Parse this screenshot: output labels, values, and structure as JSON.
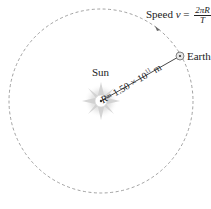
{
  "diagram": {
    "orbit": {
      "cx": 101,
      "cy": 101,
      "r": 92,
      "stroke": "#8a8a8a",
      "style": "dashed"
    },
    "sun": {
      "label": "Sun",
      "x": 101,
      "y": 101,
      "glow_color": "#d8d8d8"
    },
    "earth": {
      "label": "Earth",
      "x": 180,
      "y": 56
    },
    "radius_label": {
      "prefix": "R",
      "text": "= 1.50 × 10",
      "exponent": "11",
      "unit": " m"
    },
    "speed_label": {
      "prefix": "Speed ",
      "var": "v",
      "eq": " = ",
      "numerator": "2πR",
      "denominator": "T"
    },
    "arrow_direction": "counterclockwise"
  }
}
